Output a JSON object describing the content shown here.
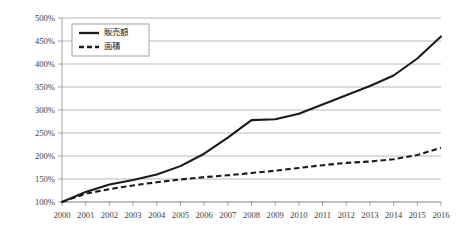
{
  "chart_data": {
    "type": "line",
    "title": "",
    "subtitle": "",
    "xlabel": "",
    "ylabel": "",
    "grid": true,
    "legend_position": "top-left-inside",
    "x": [
      2000,
      2001,
      2002,
      2003,
      2004,
      2005,
      2006,
      2007,
      2008,
      2009,
      2010,
      2011,
      2012,
      2013,
      2014,
      2015,
      2016
    ],
    "categories": [
      "2000",
      "2001",
      "2002",
      "2003",
      "2004",
      "2005",
      "2006",
      "2007",
      "2008",
      "2009",
      "2010",
      "2011",
      "2012",
      "2013",
      "2014",
      "2015",
      "2016"
    ],
    "ylim": [
      100,
      500
    ],
    "yticks": [
      100,
      150,
      200,
      250,
      300,
      350,
      400,
      450,
      500
    ],
    "ytick_labels": [
      "100%",
      "150%",
      "200%",
      "250%",
      "300%",
      "350%",
      "400%",
      "450%",
      "500%"
    ],
    "y_unit": "%",
    "series": [
      {
        "name": "販売額",
        "style": "solid",
        "color": "#1a1a1a",
        "values": [
          100,
          122,
          138,
          148,
          160,
          178,
          205,
          240,
          278,
          280,
          292,
          312,
          332,
          352,
          375,
          412,
          460
        ]
      },
      {
        "name": "面積",
        "style": "dashed",
        "color": "#1a1a1a",
        "values": [
          100,
          118,
          128,
          136,
          143,
          149,
          154,
          158,
          163,
          168,
          174,
          180,
          185,
          188,
          193,
          202,
          218
        ]
      }
    ]
  },
  "legend": {
    "items": [
      {
        "label": "販売額",
        "style": "solid"
      },
      {
        "label": "面積",
        "style": "dashed"
      }
    ]
  },
  "colors": {
    "line": "#1a1a1a",
    "grid": "#a6a6a6",
    "axis": "#9a9a9a",
    "tick_text": "#3c3c3c",
    "background": "#ffffff"
  }
}
